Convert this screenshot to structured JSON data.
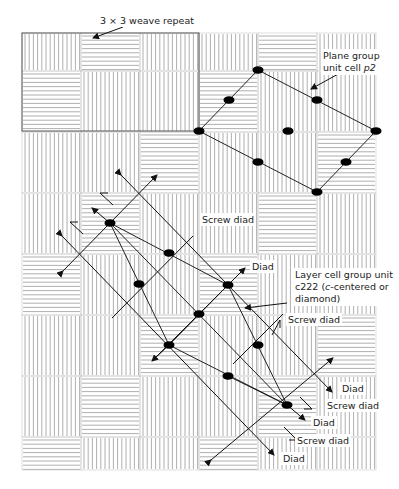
{
  "figure": {
    "weave": {
      "columns": 6,
      "rows": 8,
      "origin_x": 22,
      "col_width": 59,
      "row_top": 33,
      "row_boundaries": [
        33,
        71,
        132,
        193,
        254,
        315,
        376,
        437,
        470
      ],
      "h_row_mod_by_col": [
        1,
        0,
        2,
        1,
        0,
        2
      ],
      "line_color": "#9a9a9a",
      "border_color": "#8a8a8a"
    },
    "repeat_box": {
      "x": 22,
      "y": 33,
      "w": 177,
      "h": 98
    },
    "labels": {
      "weave_repeat": "3 × 3 weave repeat",
      "plane_group_line1": "Plane group",
      "plane_group_line2_prefix": "unit cell ",
      "plane_group_symbol": "p2",
      "screw_diad_1": "Screw diad",
      "diad_1": "Diad",
      "layer_cell_line1": "Layer cell  group unit",
      "layer_cell_line2_a": "c222 (",
      "layer_cell_line2_c": "c",
      "layer_cell_line2_b": "-centered or",
      "layer_cell_line3": "diamond)",
      "screw_diad_2": "Screw diad",
      "diad_2": "Diad",
      "screw_diad_3": "Screw diad",
      "diad_3": "Diad",
      "screw_diad_4": "Screw diad",
      "diad_4": "Diad"
    },
    "p2_cell": {
      "vertices": [
        [
          199,
          131
        ],
        [
          258,
          70
        ],
        [
          376,
          131
        ],
        [
          317,
          192
        ]
      ],
      "dots": [
        [
          199,
          131
        ],
        [
          258,
          70
        ],
        [
          376,
          131
        ],
        [
          317,
          192
        ],
        [
          229,
          100
        ],
        [
          317,
          100
        ],
        [
          288,
          131
        ],
        [
          258,
          162
        ],
        [
          346,
          162
        ]
      ]
    },
    "c222_cell": {
      "dots": [
        [
          110,
          223
        ],
        [
          169,
          253
        ],
        [
          139,
          284
        ],
        [
          228,
          285
        ],
        [
          199,
          314
        ],
        [
          169,
          345
        ],
        [
          258,
          345
        ],
        [
          228,
          376
        ],
        [
          287,
          405
        ]
      ]
    },
    "colors": {
      "ink": "#111111",
      "text": "#222222"
    }
  }
}
